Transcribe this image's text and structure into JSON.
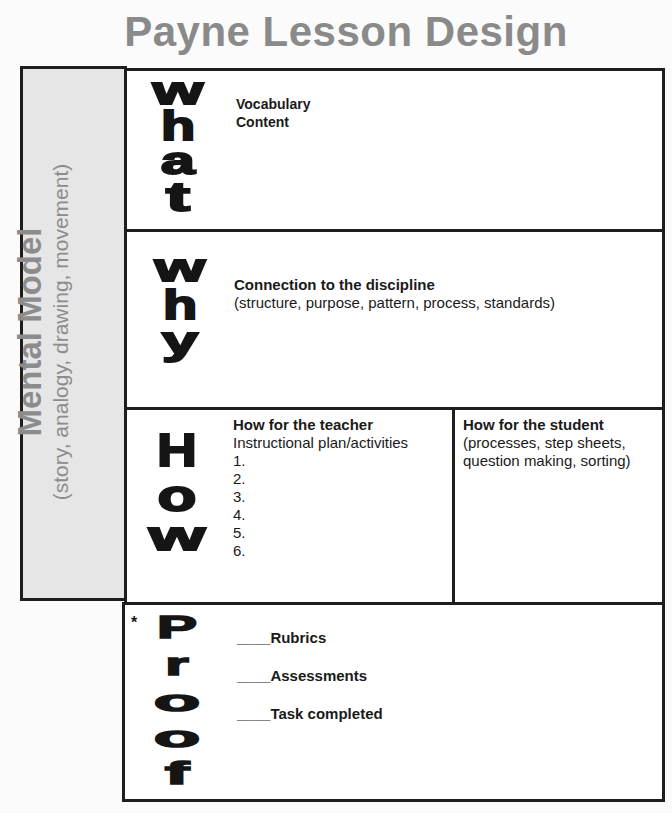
{
  "title": "Payne Lesson Design",
  "mental_model": {
    "title": "Mental Model",
    "subtitle": "(story, analogy, drawing, movement)"
  },
  "what": {
    "letters": [
      "w",
      "h",
      "a",
      "t"
    ],
    "lines": [
      "Vocabulary",
      "Content"
    ]
  },
  "why": {
    "letters": [
      "w",
      "h",
      "y"
    ],
    "heading": "Connection to the discipline",
    "detail": "(structure, purpose, pattern, process, standards)"
  },
  "how": {
    "letters": [
      "H",
      "o",
      "w"
    ],
    "teacher": {
      "heading": "How for the teacher",
      "subheading": "Instructional plan/activities",
      "items": [
        "1.",
        "2.",
        "3.",
        "4.",
        "5.",
        "6."
      ]
    },
    "student": {
      "heading": "How for the student",
      "detail_lines": [
        "(processes, step sheets,",
        "question making, sorting)"
      ]
    }
  },
  "proof": {
    "marker": "*",
    "letters": [
      "P",
      "r",
      "o",
      "o",
      "f"
    ],
    "checklist": [
      {
        "blank": "____",
        "label": "Rubrics"
      },
      {
        "blank": "____",
        "label": "Assessments"
      },
      {
        "blank": "____",
        "label": "Task completed"
      }
    ]
  }
}
